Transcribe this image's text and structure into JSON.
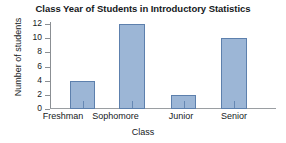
{
  "chart_data": {
    "type": "bar",
    "title": "Class Year of Students in Introductory Statistics",
    "xlabel": "Class",
    "ylabel": "Number of students",
    "categories": [
      "Freshman",
      "Sophomore",
      "Junior",
      "Senior"
    ],
    "values": [
      4,
      12,
      2,
      10
    ],
    "ylim": [
      0,
      12
    ],
    "yticks": [
      0,
      2,
      4,
      6,
      8,
      10,
      12
    ],
    "ytick_labels": [
      "0",
      "2",
      "4",
      "6",
      "8",
      "10",
      "12"
    ],
    "grid": false,
    "legend": null,
    "bar_fill_color": "#9cb6d6",
    "bar_border_color": "#5d80ad",
    "axis_color": "#8b8f93",
    "text_color": "#15191c"
  }
}
